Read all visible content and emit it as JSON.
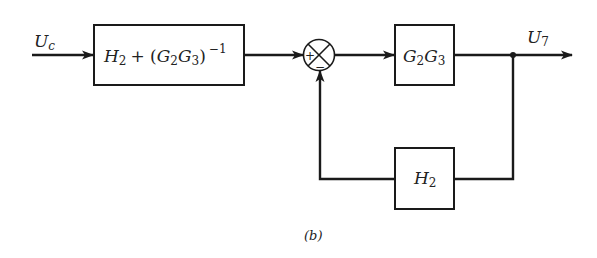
{
  "diagram": {
    "type": "block-diagram",
    "caption": "(b)",
    "input_signal": {
      "symbol": "U",
      "subscript": "c"
    },
    "output_signal": {
      "symbol": "U",
      "subscript": "7"
    },
    "blocks": [
      {
        "id": "prefilter",
        "label_parts": [
          "H",
          "2",
          " + (",
          "G",
          "2",
          "G",
          "3",
          ")",
          "−1"
        ],
        "text": "H2 + (G2G3)^-1"
      },
      {
        "id": "forward",
        "text": "G2G3"
      },
      {
        "id": "feedback",
        "text": "H2"
      }
    ],
    "summing_junction": {
      "signs": [
        "+",
        "−"
      ]
    },
    "connections": [
      "Uc -> H2 + (G2G3)^-1",
      "H2 + (G2G3)^-1 -> summing junction (+)",
      "summing junction -> G2G3",
      "G2G3 -> U7",
      "U7 branch -> H2",
      "H2 -> summing junction (−)"
    ]
  },
  "labels": {
    "uc_main": "U",
    "uc_sub": "c",
    "u7_main": "U",
    "u7_sub": "7",
    "pre_H": "H",
    "pre_H_sub": "2",
    "pre_plus": "+ (",
    "pre_G1": "G",
    "pre_G1_sub": "2",
    "pre_G2": "G",
    "pre_G2_sub": "3",
    "pre_close": ")",
    "pre_exp": "−1",
    "fwd_G1": "G",
    "fwd_G1_sub": "2",
    "fwd_G2": "G",
    "fwd_G2_sub": "3",
    "fb_H": "H",
    "fb_H_sub": "2",
    "sum_plus": "+",
    "sum_minus": "−",
    "caption": "(b)"
  }
}
